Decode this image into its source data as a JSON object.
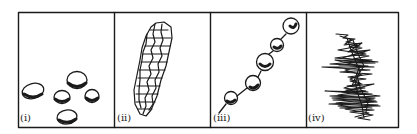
{
  "figure": {
    "stroke_color": "#1a1a1a",
    "background": "#ffffff",
    "panels": [
      {
        "id": "i",
        "label": "(i)",
        "depicts": "separate oval cells (scattered)"
      },
      {
        "id": "ii",
        "label": "(ii)",
        "depicts": "elongated clustered mass of polygonal cells"
      },
      {
        "id": "iii",
        "label": "(iii)",
        "depicts": "chain of beaded round cells"
      },
      {
        "id": "iv",
        "label": "(iv)",
        "depicts": "dense tangled filament mass"
      }
    ]
  }
}
